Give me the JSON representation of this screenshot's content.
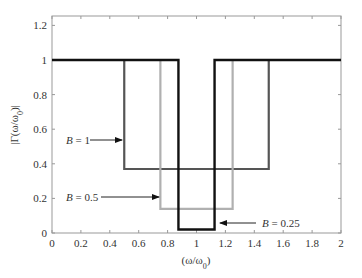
{
  "chart_data": {
    "type": "line",
    "title": "",
    "xlabel": "(ω/ω0)",
    "ylabel": "|Γ(ω/ω0)|",
    "xlim": [
      0,
      2
    ],
    "ylim": [
      0,
      1.25
    ],
    "xticks": [
      "0",
      "0.2",
      "0.4",
      "0.6",
      "0.8",
      "1",
      "1.2",
      "1.4",
      "1.6",
      "1.8",
      "2"
    ],
    "yticks": [
      "0",
      "0.2",
      "0.4",
      "0.6",
      "0.8",
      "1",
      "1.2"
    ],
    "grid": false,
    "series": [
      {
        "name": "B = 1",
        "color": "#555555",
        "x": [
          0,
          0.5,
          0.5,
          1.5,
          1.5,
          2
        ],
        "y": [
          1,
          1,
          0.37,
          0.37,
          1,
          1
        ]
      },
      {
        "name": "B = 0.5",
        "color": "#b0b0b0",
        "x": [
          0,
          0.75,
          0.75,
          1.25,
          1.25,
          2
        ],
        "y": [
          1,
          1,
          0.14,
          0.14,
          1,
          1
        ]
      },
      {
        "name": "B = 0.25",
        "color": "#111111",
        "x": [
          0,
          0.875,
          0.875,
          1.125,
          1.125,
          2
        ],
        "y": [
          1,
          1,
          0.02,
          0.02,
          1,
          1
        ]
      }
    ],
    "annotations": [
      {
        "text": "B = 1",
        "target": "B = 1 series lower level"
      },
      {
        "text": "B = 0.5",
        "target": "B = 0.5 series lower level"
      },
      {
        "text": "B = 0.25",
        "target": "B = 0.25 series lower level"
      }
    ]
  }
}
